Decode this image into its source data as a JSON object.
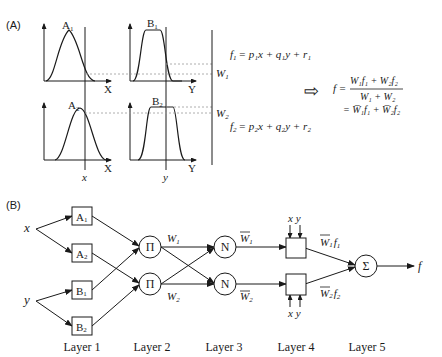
{
  "panel_a": {
    "label": "(A)",
    "plots": [
      {
        "id": "A1",
        "name": "A",
        "sub": "1",
        "axis": "X",
        "shape": "gaussian"
      },
      {
        "id": "B1",
        "name": "B",
        "sub": "1",
        "axis": "Y",
        "shape": "plateau"
      },
      {
        "id": "A2",
        "name": "A",
        "sub": "2",
        "axis": "X",
        "shape": "gaussian"
      },
      {
        "id": "B2",
        "name": "B",
        "sub": "2",
        "axis": "Y",
        "shape": "plateau"
      }
    ],
    "input_x": "x",
    "input_y": "y",
    "w1": {
      "name": "W",
      "sub": "1"
    },
    "w2": {
      "name": "W",
      "sub": "2"
    },
    "rule1": {
      "lhs": "f",
      "lhs_sub": "1",
      "rhs": "= p₁x + q₁y + r₁"
    },
    "rule2": {
      "lhs": "f",
      "lhs_sub": "2",
      "rhs": "= p₂x + q₂y + r₂"
    },
    "implies_arrow": "⇨",
    "output_eq": {
      "lhs": "f =",
      "numerator": "W₁f₁ + W₂f₂",
      "denominator": "W₁ + W₂",
      "line2": "= W̅₁f₁ + W̅₂f₂"
    }
  },
  "panel_b": {
    "label": "(B)",
    "inputs": {
      "x": "x",
      "y": "y"
    },
    "layer1": [
      {
        "name": "A",
        "sub": "1"
      },
      {
        "name": "A",
        "sub": "2"
      },
      {
        "name": "B",
        "sub": "1"
      },
      {
        "name": "B",
        "sub": "2"
      }
    ],
    "layer2": [
      {
        "symbol": "Π"
      },
      {
        "symbol": "Π"
      }
    ],
    "layer2_outputs": [
      {
        "name": "W",
        "sub": "1"
      },
      {
        "name": "W",
        "sub": "2"
      }
    ],
    "layer3": [
      {
        "symbol": "N"
      },
      {
        "symbol": "N"
      }
    ],
    "layer3_outputs": [
      {
        "name": "W",
        "sub": "1",
        "bar": true
      },
      {
        "name": "W",
        "sub": "2",
        "bar": true
      }
    ],
    "layer4_inputs": {
      "top": "x y",
      "bottom": "x y"
    },
    "layer4_outputs": [
      {
        "name": "W",
        "sub": "1",
        "f": "f",
        "fsub": "1"
      },
      {
        "name": "W",
        "sub": "2",
        "f": "f",
        "fsub": "2"
      }
    ],
    "layer5": {
      "symbol": "Σ"
    },
    "output": "f",
    "layer_labels": [
      "Layer 1",
      "Layer 2",
      "Layer 3",
      "Layer 4",
      "Layer 5"
    ]
  }
}
